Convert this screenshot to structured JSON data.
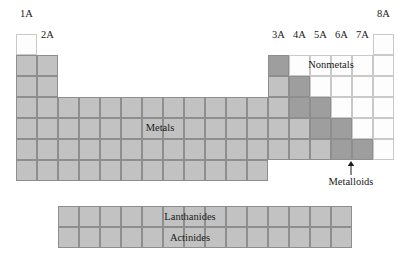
{
  "figure": {
    "kind": "periodic-table-regions-diagram",
    "background": "#ffffff"
  },
  "colors": {
    "metal_fill": "#c2c2c2",
    "metalloid_fill": "#9e9e9e",
    "nonmetal_fill": "#fdfdfd",
    "grid_line": "#8e8e8e",
    "nonmetal_grid_line": "#c9c9c9",
    "text": "#1a1a1a"
  },
  "geometry": {
    "cell_width": 21,
    "cell_height": 21,
    "main_origin_x": 16,
    "main_origin_y": 34,
    "series_origin_x": 58,
    "series_origin_y": 206,
    "series_columns": 14,
    "series_rows": 2
  },
  "group_labels": [
    {
      "text": "1A",
      "x": 16,
      "y": 8,
      "width": 21
    },
    {
      "text": "2A",
      "x": 37,
      "y": 29,
      "width": 21
    },
    {
      "text": "3A",
      "x": 268,
      "y": 29,
      "width": 21
    },
    {
      "text": "4A",
      "x": 289,
      "y": 29,
      "width": 21
    },
    {
      "text": "5A",
      "x": 310,
      "y": 29,
      "width": 21
    },
    {
      "text": "6A",
      "x": 331,
      "y": 29,
      "width": 21
    },
    {
      "text": "7A",
      "x": 352,
      "y": 29,
      "width": 21
    },
    {
      "text": "8A",
      "x": 373,
      "y": 8,
      "width": 21
    }
  ],
  "region_labels": [
    {
      "name": "metals",
      "text": "Metals",
      "x": 120,
      "y": 122,
      "width": 80
    },
    {
      "name": "nonmetals",
      "text": "Nonmetals",
      "x": 291,
      "y": 59,
      "width": 80
    }
  ],
  "callout": {
    "name": "metalloids",
    "text": "Metalloids",
    "text_x": 311,
    "text_y": 176,
    "text_width": 80,
    "arrow_x": 346,
    "arrow_y": 161
  },
  "series_labels": [
    {
      "name": "lanthanides",
      "text": "Lanthanides",
      "x": 150,
      "y": 211,
      "width": 80
    },
    {
      "name": "actinides",
      "text": "Actinides",
      "x": 150,
      "y": 232,
      "width": 80
    }
  ],
  "main_grid_cells": [
    {
      "col": 1,
      "row": 1,
      "type": "nonmetal"
    },
    {
      "col": 18,
      "row": 1,
      "type": "nonmetal"
    },
    {
      "col": 1,
      "row": 2,
      "type": "metal"
    },
    {
      "col": 2,
      "row": 2,
      "type": "metal"
    },
    {
      "col": 13,
      "row": 2,
      "type": "metalloid"
    },
    {
      "col": 14,
      "row": 2,
      "type": "nonmetal"
    },
    {
      "col": 15,
      "row": 2,
      "type": "nonmetal"
    },
    {
      "col": 16,
      "row": 2,
      "type": "nonmetal"
    },
    {
      "col": 17,
      "row": 2,
      "type": "nonmetal"
    },
    {
      "col": 18,
      "row": 2,
      "type": "nonmetal"
    },
    {
      "col": 1,
      "row": 3,
      "type": "metal"
    },
    {
      "col": 2,
      "row": 3,
      "type": "metal"
    },
    {
      "col": 13,
      "row": 3,
      "type": "metal"
    },
    {
      "col": 14,
      "row": 3,
      "type": "metalloid"
    },
    {
      "col": 15,
      "row": 3,
      "type": "nonmetal"
    },
    {
      "col": 16,
      "row": 3,
      "type": "nonmetal"
    },
    {
      "col": 17,
      "row": 3,
      "type": "nonmetal"
    },
    {
      "col": 18,
      "row": 3,
      "type": "nonmetal"
    },
    {
      "col": 1,
      "row": 4,
      "type": "metal"
    },
    {
      "col": 2,
      "row": 4,
      "type": "metal"
    },
    {
      "col": 3,
      "row": 4,
      "type": "metal"
    },
    {
      "col": 4,
      "row": 4,
      "type": "metal"
    },
    {
      "col": 5,
      "row": 4,
      "type": "metal"
    },
    {
      "col": 6,
      "row": 4,
      "type": "metal"
    },
    {
      "col": 7,
      "row": 4,
      "type": "metal"
    },
    {
      "col": 8,
      "row": 4,
      "type": "metal"
    },
    {
      "col": 9,
      "row": 4,
      "type": "metal"
    },
    {
      "col": 10,
      "row": 4,
      "type": "metal"
    },
    {
      "col": 11,
      "row": 4,
      "type": "metal"
    },
    {
      "col": 12,
      "row": 4,
      "type": "metal"
    },
    {
      "col": 13,
      "row": 4,
      "type": "metal"
    },
    {
      "col": 14,
      "row": 4,
      "type": "metalloid"
    },
    {
      "col": 15,
      "row": 4,
      "type": "metalloid"
    },
    {
      "col": 16,
      "row": 4,
      "type": "nonmetal"
    },
    {
      "col": 17,
      "row": 4,
      "type": "nonmetal"
    },
    {
      "col": 18,
      "row": 4,
      "type": "nonmetal"
    },
    {
      "col": 1,
      "row": 5,
      "type": "metal"
    },
    {
      "col": 2,
      "row": 5,
      "type": "metal"
    },
    {
      "col": 3,
      "row": 5,
      "type": "metal"
    },
    {
      "col": 4,
      "row": 5,
      "type": "metal"
    },
    {
      "col": 5,
      "row": 5,
      "type": "metal"
    },
    {
      "col": 6,
      "row": 5,
      "type": "metal"
    },
    {
      "col": 7,
      "row": 5,
      "type": "metal"
    },
    {
      "col": 8,
      "row": 5,
      "type": "metal"
    },
    {
      "col": 9,
      "row": 5,
      "type": "metal"
    },
    {
      "col": 10,
      "row": 5,
      "type": "metal"
    },
    {
      "col": 11,
      "row": 5,
      "type": "metal"
    },
    {
      "col": 12,
      "row": 5,
      "type": "metal"
    },
    {
      "col": 13,
      "row": 5,
      "type": "metal"
    },
    {
      "col": 14,
      "row": 5,
      "type": "metal"
    },
    {
      "col": 15,
      "row": 5,
      "type": "metalloid"
    },
    {
      "col": 16,
      "row": 5,
      "type": "metalloid"
    },
    {
      "col": 17,
      "row": 5,
      "type": "nonmetal"
    },
    {
      "col": 18,
      "row": 5,
      "type": "nonmetal"
    },
    {
      "col": 1,
      "row": 6,
      "type": "metal"
    },
    {
      "col": 2,
      "row": 6,
      "type": "metal"
    },
    {
      "col": 3,
      "row": 6,
      "type": "metal"
    },
    {
      "col": 4,
      "row": 6,
      "type": "metal"
    },
    {
      "col": 5,
      "row": 6,
      "type": "metal"
    },
    {
      "col": 6,
      "row": 6,
      "type": "metal"
    },
    {
      "col": 7,
      "row": 6,
      "type": "metal"
    },
    {
      "col": 8,
      "row": 6,
      "type": "metal"
    },
    {
      "col": 9,
      "row": 6,
      "type": "metal"
    },
    {
      "col": 10,
      "row": 6,
      "type": "metal"
    },
    {
      "col": 11,
      "row": 6,
      "type": "metal"
    },
    {
      "col": 12,
      "row": 6,
      "type": "metal"
    },
    {
      "col": 13,
      "row": 6,
      "type": "metal"
    },
    {
      "col": 14,
      "row": 6,
      "type": "metal"
    },
    {
      "col": 15,
      "row": 6,
      "type": "metal"
    },
    {
      "col": 16,
      "row": 6,
      "type": "metalloid"
    },
    {
      "col": 17,
      "row": 6,
      "type": "metalloid"
    },
    {
      "col": 18,
      "row": 6,
      "type": "nonmetal"
    },
    {
      "col": 1,
      "row": 7,
      "type": "metal"
    },
    {
      "col": 2,
      "row": 7,
      "type": "metal"
    },
    {
      "col": 3,
      "row": 7,
      "type": "metal"
    },
    {
      "col": 4,
      "row": 7,
      "type": "metal"
    },
    {
      "col": 5,
      "row": 7,
      "type": "metal"
    },
    {
      "col": 6,
      "row": 7,
      "type": "metal"
    },
    {
      "col": 7,
      "row": 7,
      "type": "metal"
    },
    {
      "col": 8,
      "row": 7,
      "type": "metal"
    },
    {
      "col": 9,
      "row": 7,
      "type": "metal"
    },
    {
      "col": 10,
      "row": 7,
      "type": "metal"
    },
    {
      "col": 11,
      "row": 7,
      "type": "metal"
    },
    {
      "col": 12,
      "row": 7,
      "type": "metal"
    }
  ],
  "series_grid_cells": [
    {
      "col": 1,
      "row": 1,
      "type": "metal"
    },
    {
      "col": 2,
      "row": 1,
      "type": "metal"
    },
    {
      "col": 3,
      "row": 1,
      "type": "metal"
    },
    {
      "col": 4,
      "row": 1,
      "type": "metal"
    },
    {
      "col": 5,
      "row": 1,
      "type": "metal"
    },
    {
      "col": 6,
      "row": 1,
      "type": "metal"
    },
    {
      "col": 7,
      "row": 1,
      "type": "metal"
    },
    {
      "col": 8,
      "row": 1,
      "type": "metal"
    },
    {
      "col": 9,
      "row": 1,
      "type": "metal"
    },
    {
      "col": 10,
      "row": 1,
      "type": "metal"
    },
    {
      "col": 11,
      "row": 1,
      "type": "metal"
    },
    {
      "col": 12,
      "row": 1,
      "type": "metal"
    },
    {
      "col": 13,
      "row": 1,
      "type": "metal"
    },
    {
      "col": 14,
      "row": 1,
      "type": "metal"
    },
    {
      "col": 1,
      "row": 2,
      "type": "metal"
    },
    {
      "col": 2,
      "row": 2,
      "type": "metal"
    },
    {
      "col": 3,
      "row": 2,
      "type": "metal"
    },
    {
      "col": 4,
      "row": 2,
      "type": "metal"
    },
    {
      "col": 5,
      "row": 2,
      "type": "metal"
    },
    {
      "col": 6,
      "row": 2,
      "type": "metal"
    },
    {
      "col": 7,
      "row": 2,
      "type": "metal"
    },
    {
      "col": 8,
      "row": 2,
      "type": "metal"
    },
    {
      "col": 9,
      "row": 2,
      "type": "metal"
    },
    {
      "col": 10,
      "row": 2,
      "type": "metal"
    },
    {
      "col": 11,
      "row": 2,
      "type": "metal"
    },
    {
      "col": 12,
      "row": 2,
      "type": "metal"
    },
    {
      "col": 13,
      "row": 2,
      "type": "metal"
    },
    {
      "col": 14,
      "row": 2,
      "type": "metal"
    }
  ]
}
